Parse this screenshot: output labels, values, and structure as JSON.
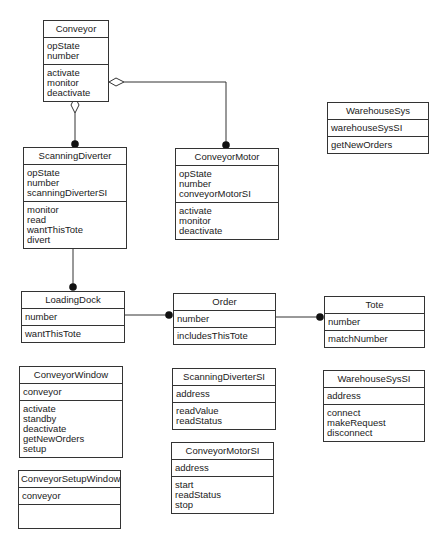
{
  "diagram": {
    "type": "uml-class-diagram",
    "classes": [
      {
        "id": "conveyor",
        "name": "Conveyor",
        "attributes": [
          "opState",
          "number"
        ],
        "operations": [
          "activate",
          "monitor",
          "deactivate"
        ],
        "box": {
          "x": 43,
          "y": 20,
          "w": 66
        }
      },
      {
        "id": "scanningDiverter",
        "name": "ScanningDiverter",
        "attributes": [
          "opState",
          "number",
          "scanningDiverterSI"
        ],
        "operations": [
          "monitor",
          "read",
          "wantThisTote",
          "divert"
        ],
        "box": {
          "x": 23,
          "y": 147,
          "w": 104
        }
      },
      {
        "id": "conveyorMotor",
        "name": "ConveyorMotor",
        "attributes": [
          "opState",
          "number",
          "conveyorMotorSI"
        ],
        "operations": [
          "activate",
          "monitor",
          "deactivate"
        ],
        "box": {
          "x": 175,
          "y": 148,
          "w": 104
        }
      },
      {
        "id": "warehouseSys",
        "name": "WarehouseSys",
        "attributes": [
          "warehouseSysSI"
        ],
        "operations": [
          "getNewOrders"
        ],
        "box": {
          "x": 327,
          "y": 102,
          "w": 102
        }
      },
      {
        "id": "loadingDock",
        "name": "LoadingDock",
        "attributes": [
          "number"
        ],
        "operations": [
          "wantThisTote"
        ],
        "box": {
          "x": 21,
          "y": 291,
          "w": 104
        }
      },
      {
        "id": "order",
        "name": "Order",
        "attributes": [
          "number"
        ],
        "operations": [
          "includesThisTote"
        ],
        "box": {
          "x": 173,
          "y": 293,
          "w": 103
        }
      },
      {
        "id": "tote",
        "name": "Tote",
        "attributes": [
          "number"
        ],
        "operations": [
          "matchNumber"
        ],
        "box": {
          "x": 324,
          "y": 296,
          "w": 101
        }
      },
      {
        "id": "conveyorWindow",
        "name": "ConveyorWindow",
        "attributes": [
          "conveyor"
        ],
        "operations": [
          "activate",
          "standby",
          "deactivate",
          "getNewOrders",
          "setup"
        ],
        "box": {
          "x": 19,
          "y": 366,
          "w": 104
        }
      },
      {
        "id": "conveyorSetupWindow",
        "name": "ConveyorSetupWindow",
        "attributes": [
          "conveyor"
        ],
        "operations": [],
        "box": {
          "x": 18,
          "y": 470,
          "w": 103
        }
      },
      {
        "id": "scanningDiverterSI",
        "name": "ScanningDiverterSI",
        "attributes": [
          "address"
        ],
        "operations": [
          "readValue",
          "readStatus"
        ],
        "box": {
          "x": 172,
          "y": 368,
          "w": 104
        }
      },
      {
        "id": "conveyorMotorSI",
        "name": "ConveyorMotorSI",
        "attributes": [
          "address"
        ],
        "operations": [
          "start",
          "readStatus",
          "stop"
        ],
        "box": {
          "x": 171,
          "y": 442,
          "w": 103
        }
      },
      {
        "id": "warehouseSysSI",
        "name": "WarehouseSysSI",
        "attributes": [
          "address"
        ],
        "operations": [
          "connect",
          "makeRequest",
          "disconnect"
        ],
        "box": {
          "x": 323,
          "y": 370,
          "w": 102
        }
      }
    ],
    "relationships": [
      {
        "from": "conveyor",
        "to": "scanningDiverter",
        "kind": "aggregation",
        "source_end": "hollow-diamond",
        "target_end": "filled-dot-many"
      },
      {
        "from": "conveyor",
        "to": "conveyorMotor",
        "kind": "aggregation",
        "source_end": "hollow-diamond",
        "target_end": "filled-dot-many"
      },
      {
        "from": "scanningDiverter",
        "to": "loadingDock",
        "kind": "association",
        "target_end": "filled-dot-many"
      },
      {
        "from": "loadingDock",
        "to": "order",
        "kind": "association",
        "target_end": "filled-dot-many"
      },
      {
        "from": "order",
        "to": "tote",
        "kind": "association",
        "target_end": "filled-dot-many"
      }
    ],
    "colors": {
      "line": "#333333",
      "background": "#ffffff",
      "text": "#1a1a1a"
    }
  }
}
